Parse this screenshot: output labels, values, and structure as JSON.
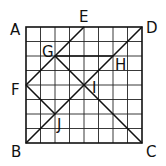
{
  "diagram": {
    "type": "geometry-grid",
    "grid": {
      "cols": 8,
      "rows": 8,
      "origin_px": [
        26,
        27
      ],
      "cell_px": 14.5
    },
    "colors": {
      "line": "#111111",
      "grid": "#222222",
      "background": "#ffffff"
    },
    "points": [
      {
        "name": "A",
        "grid": [
          0,
          0
        ],
        "label": "A",
        "label_px": [
          10,
          35
        ]
      },
      {
        "name": "E",
        "grid": [
          4,
          0
        ],
        "label": "E",
        "label_px": [
          79,
          22
        ]
      },
      {
        "name": "D",
        "grid": [
          8,
          0
        ],
        "label": "D",
        "label_px": [
          146,
          33
        ]
      },
      {
        "name": "G",
        "grid": [
          2,
          2
        ],
        "label": "G",
        "label_px": [
          42,
          57
        ]
      },
      {
        "name": "H",
        "grid": [
          6,
          2
        ],
        "label": "H",
        "label_px": [
          115,
          70
        ]
      },
      {
        "name": "F",
        "grid": [
          0,
          4
        ],
        "label": "F",
        "label_px": [
          11,
          95
        ]
      },
      {
        "name": "I",
        "grid": [
          4,
          4
        ],
        "label": "I",
        "label_px": [
          92,
          93
        ]
      },
      {
        "name": "J",
        "grid": [
          2,
          6
        ],
        "label": "J",
        "label_px": [
          57,
          130
        ]
      },
      {
        "name": "B",
        "grid": [
          0,
          8
        ],
        "label": "B",
        "label_px": [
          11,
          157
        ]
      },
      {
        "name": "C",
        "grid": [
          8,
          8
        ],
        "label": "C",
        "label_px": [
          146,
          157
        ]
      }
    ],
    "segments": [
      {
        "from": "E",
        "to": "F"
      },
      {
        "from": "B",
        "to": "D"
      },
      {
        "from": "G",
        "to": "C"
      },
      {
        "from": "G",
        "to": "H"
      },
      {
        "from": "F",
        "to": "J"
      }
    ]
  }
}
